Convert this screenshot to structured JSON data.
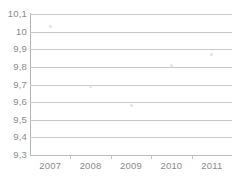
{
  "chart_data": {
    "type": "scatter",
    "title": "",
    "subtitle": "",
    "xlabel": "",
    "ylabel": "",
    "categories": [
      "2007",
      "2008",
      "2009",
      "2010",
      "2011"
    ],
    "values": [
      10.03,
      9.69,
      9.58,
      9.81,
      9.87
    ],
    "series": [
      {
        "name": "",
        "values": [
          10.03,
          9.69,
          9.58,
          9.81,
          9.87
        ]
      }
    ],
    "ylim": [
      9.3,
      10.1
    ],
    "y_ticks": [
      9.3,
      9.4,
      9.5,
      9.6,
      9.7,
      9.8,
      9.9,
      10.0,
      10.1
    ],
    "y_tick_labels": [
      "9,3",
      "9,4",
      "9,5",
      "9,6",
      "9,7",
      "9,8",
      "9,9",
      "10",
      "10,1"
    ],
    "x_tick_labels": [
      "2007",
      "2008",
      "2009",
      "2010",
      "2011"
    ],
    "grid": "horizontal",
    "legend": "none",
    "decimal_separator": ",",
    "colors": {
      "background": "#ffffff",
      "gridline": "#c9c9c9",
      "axis": "#b5b5b5",
      "tick_text": "#8a8a8a",
      "marker": "#e2e2e2"
    }
  }
}
